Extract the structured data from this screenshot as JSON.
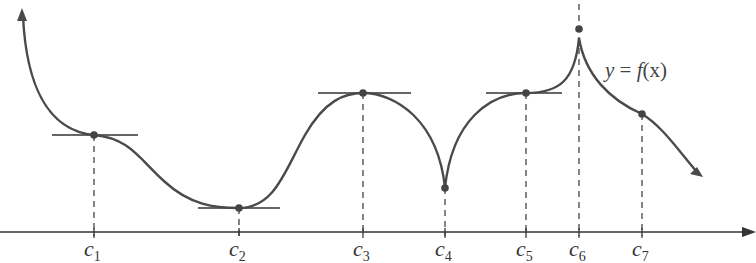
{
  "figure": {
    "function_label": {
      "y": "y",
      "eq": " = ",
      "f": "f",
      "x": "(x)"
    },
    "curve_color": "#4a4a4a",
    "axis_color": "#333333",
    "critical_points": [
      {
        "name": "c",
        "sub": "1",
        "x": 94,
        "y": 135,
        "tangent": [
          52,
          138
        ],
        "type": "horizontal-tangent-inflection"
      },
      {
        "name": "c",
        "sub": "2",
        "x": 239,
        "y": 208,
        "tangent": [
          198,
          280
        ],
        "type": "local-min"
      },
      {
        "name": "c",
        "sub": "3",
        "x": 363,
        "y": 93,
        "tangent": [
          318,
          411
        ],
        "type": "local-max"
      },
      {
        "name": "c",
        "sub": "4",
        "x": 445,
        "y": 188,
        "tangent": null,
        "type": "cusp-min"
      },
      {
        "name": "c",
        "sub": "5",
        "x": 526,
        "y": 93,
        "tangent": [
          486,
          562
        ],
        "type": "horizontal-tangent-inflection"
      },
      {
        "name": "c",
        "sub": "6",
        "x": 579,
        "y": 29,
        "tangent": null,
        "type": "cusp-max"
      },
      {
        "name": "c",
        "sub": "7",
        "x": 642,
        "y": 114,
        "tangent": null,
        "type": "corner"
      }
    ]
  }
}
